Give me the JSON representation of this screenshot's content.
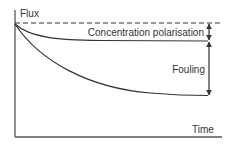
{
  "diagram": {
    "labels": {
      "y_axis": "Flux",
      "x_axis": "Time",
      "concentration_polarisation": "Concentration polarisation",
      "fouling": "Fouling"
    },
    "elements": {
      "initial_flux_line": "dashed reference line (initial flux)",
      "upper_curve": "flux with concentration polarisation only",
      "lower_curve": "flux with fouling"
    },
    "colors": {
      "line": "#333333",
      "text": "#333333",
      "background": "#ffffff"
    }
  }
}
